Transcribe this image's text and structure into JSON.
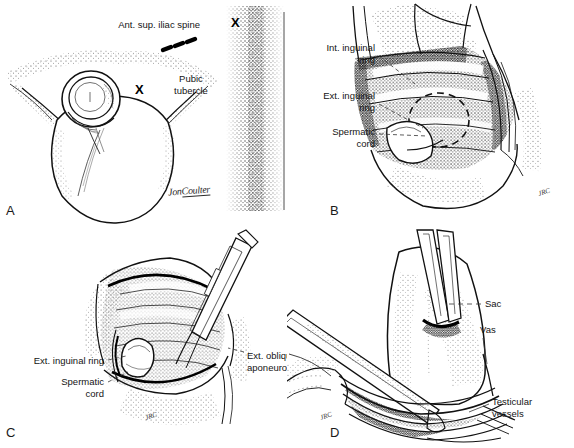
{
  "figure": {
    "style": "pen-and-ink stipple medical illustration",
    "panel_count": 4,
    "ink_color": "#000000",
    "background_color": "#ffffff"
  },
  "artist": {
    "signature_first": "Jon",
    "signature_last": "Coulter",
    "initials": "JRC"
  },
  "panels": [
    {
      "letter": "A",
      "name": "surface-landmarks",
      "labels": [
        {
          "id": "ant-sup-iliac-spine",
          "text": "Ant. sup. iliac spine",
          "align": "right"
        },
        {
          "id": "pubic-tubercle",
          "text": "Pubic\ntubercle",
          "align": "center"
        }
      ],
      "markers": [
        {
          "id": "x-marker-iliac",
          "text": "X"
        },
        {
          "id": "x-marker-pubic",
          "text": "X"
        }
      ]
    },
    {
      "letter": "B",
      "name": "inguinal-canal-anatomy",
      "labels": [
        {
          "id": "int-inguinal-ring",
          "text": "Int. inguinal\nring",
          "align": "right"
        },
        {
          "id": "ext-inguinal-ring",
          "text": "Ext. inguinal\nring",
          "align": "right"
        },
        {
          "id": "spermatic-cord",
          "text": "Spermatic\ncord",
          "align": "right"
        }
      ],
      "markers": []
    },
    {
      "letter": "C",
      "name": "external-oblique-exposure",
      "labels": [
        {
          "id": "ext-inguinal-ring-c",
          "text": "Ext. inguinal ring",
          "align": "right"
        },
        {
          "id": "spermatic-cord-c",
          "text": "Spermatic\ncord",
          "align": "right"
        },
        {
          "id": "ext-oblique-aponeurosis",
          "text": "Ext. oblique\naponeurosis",
          "align": "left"
        }
      ],
      "markers": []
    },
    {
      "letter": "D",
      "name": "cord-dissection",
      "labels": [
        {
          "id": "sac",
          "text": "Sac",
          "align": "left"
        },
        {
          "id": "vas",
          "text": "Vas",
          "align": "left"
        },
        {
          "id": "testicular-vessels",
          "text": "Testicular\nvessels",
          "align": "left"
        }
      ],
      "markers": []
    }
  ]
}
